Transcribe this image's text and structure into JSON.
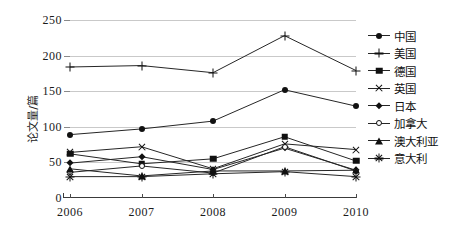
{
  "chart_data": {
    "type": "line",
    "title": "",
    "xlabel": "",
    "ylabel": "论文量/篇",
    "x": [
      "2006",
      "2007",
      "2008",
      "2009",
      "2010"
    ],
    "categories": [
      "2006",
      "2007",
      "2008",
      "2009",
      "2010"
    ],
    "ylim": [
      0,
      250
    ],
    "yticks": [
      0,
      50,
      100,
      150,
      200,
      250
    ],
    "ytick_labels": [
      "0",
      "50",
      "100",
      "150",
      "200",
      "250"
    ],
    "grid": true,
    "legend_position": "right",
    "series": [
      {
        "name": "中国",
        "marker": "filled-circle",
        "values": [
          89,
          97,
          108,
          152,
          129
        ]
      },
      {
        "name": "美国",
        "marker": "plus",
        "values": [
          184,
          186,
          176,
          228,
          179
        ]
      },
      {
        "name": "德国",
        "marker": "filled-square",
        "values": [
          62,
          48,
          55,
          86,
          52
        ]
      },
      {
        "name": "英国",
        "marker": "cross",
        "values": [
          64,
          72,
          41,
          76,
          68
        ]
      },
      {
        "name": "日本",
        "marker": "filled-diamond",
        "values": [
          49,
          58,
          40,
          70,
          39
        ]
      },
      {
        "name": "加拿大",
        "marker": "open-circle",
        "values": [
          36,
          45,
          35,
          72,
          38
        ]
      },
      {
        "name": "澳大利亚",
        "marker": "filled-triangle",
        "values": [
          41,
          31,
          38,
          38,
          39
        ]
      },
      {
        "name": "意大利",
        "marker": "star",
        "values": [
          30,
          30,
          34,
          37,
          30
        ]
      }
    ],
    "colors": {
      "line": "#262626",
      "grid": "#c9c9c9",
      "axis": "#3a3a3a",
      "text": "#1a1a1a"
    }
  }
}
